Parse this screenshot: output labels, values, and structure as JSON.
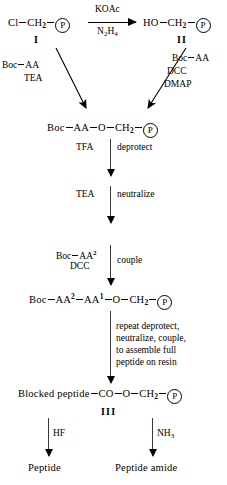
{
  "diagram": {
    "type": "reaction-scheme",
    "ink_color": "#000000",
    "background_color": "#ffffff"
  },
  "species": {
    "chloromethyl_resin": {
      "parts": [
        "Cl",
        "CH",
        "2",
        "P"
      ],
      "label": "Cl",
      "ch2": "CH",
      "ch2_sub": "2",
      "resin": "P",
      "roman": "I"
    },
    "hydroxymethyl_resin": {
      "label": "HO",
      "ch2": "CH",
      "ch2_sub": "2",
      "resin": "P",
      "roman": "II"
    },
    "boc_aa_ester": {
      "boc": "Boc",
      "aa": "AA",
      "o": "O",
      "ch2": "CH",
      "ch2_sub": "2",
      "resin": "P"
    },
    "dipeptide_resin": {
      "boc": "Boc",
      "aa2": "AA",
      "aa2_sup": "2",
      "aa1": "AA",
      "aa1_sup": "1",
      "o": "O",
      "ch2": "CH",
      "ch2_sub": "2",
      "resin": "P"
    },
    "blocked_peptide_resin": {
      "name": "Blocked peptide",
      "co": "CO",
      "o": "O",
      "ch2": "CH",
      "ch2_sub": "2",
      "resin": "P",
      "roman": "III"
    },
    "peptide": {
      "name": "Peptide"
    },
    "peptide_amide": {
      "name": "Peptide amide"
    }
  },
  "reagents": {
    "top_above": "KOAc",
    "top_below_main": "N",
    "top_below_sub1": "2",
    "top_below_h": "H",
    "top_below_sub2": "4",
    "left_branch_line1_boc": "Boc",
    "left_branch_line1_aa": "AA",
    "left_branch_line2": "TEA",
    "right_branch_line1_boc": "Boc",
    "right_branch_line1_aa": "AA",
    "right_branch_line2": "DCC",
    "right_branch_line3": "DMAP",
    "tfa": "TFA",
    "tea": "TEA",
    "couple_boc": "Boc",
    "couple_aa": "AA",
    "couple_aa_sup": "2",
    "couple_dcc": "DCC",
    "hf": "HF",
    "nh3_main": "NH",
    "nh3_sub": "3"
  },
  "steps": {
    "deprotect": "deprotect",
    "neutralize": "neutralize",
    "couple": "couple",
    "repeat_line1": "repeat deprotect,",
    "repeat_line2": "neutralize, couple,",
    "repeat_line3": "to assemble full",
    "repeat_line4": "peptide on resin"
  }
}
